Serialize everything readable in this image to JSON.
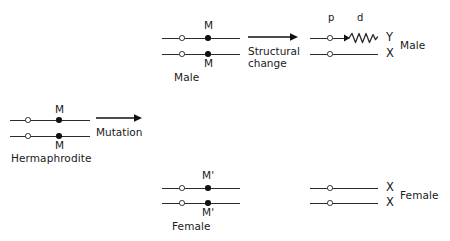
{
  "diagram": {
    "line_color": "#2b2b2b",
    "dot_color": "#111111",
    "background": "#ffffff"
  },
  "stages": {
    "hermaphrodite": {
      "caption": "Hermaphrodite",
      "allele_top": "M",
      "allele_bottom": "M"
    },
    "male_middle": {
      "caption": "Male",
      "allele_top": "M",
      "allele_bottom": "M"
    },
    "female_middle": {
      "caption": "Female",
      "allele_top": "M'",
      "allele_bottom": "M'"
    },
    "male_right": {
      "caption": "Male",
      "arm_proximal": "p",
      "arm_distal": "d",
      "chrom_top": "Y",
      "chrom_bottom": "X"
    },
    "female_right": {
      "caption": "Female",
      "chrom_top": "X",
      "chrom_bottom": "X"
    }
  },
  "arrows": {
    "mutation": {
      "label": "Mutation"
    },
    "structural_change": {
      "label_line1": "Structural",
      "label_line2": "change"
    }
  }
}
